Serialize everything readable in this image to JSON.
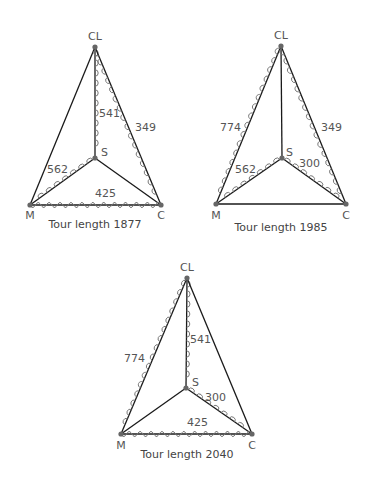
{
  "colors": {
    "edge": "#1a1a1a",
    "loops": "#777777",
    "node": "#666666",
    "text": "#555555"
  },
  "diagrams": [
    {
      "caption": "Tour length 1877",
      "caption_pos": [
        95,
        228
      ],
      "nodes": {
        "CL": {
          "label": "CL",
          "x": 95,
          "y": 47,
          "lx": 95,
          "ly": 40,
          "anchor": "middle"
        },
        "S": {
          "label": "S",
          "x": 95,
          "y": 158,
          "lx": 101,
          "ly": 156,
          "anchor": "start"
        },
        "M": {
          "label": "M",
          "x": 30,
          "y": 205,
          "lx": 30,
          "ly": 219,
          "anchor": "middle"
        },
        "C": {
          "label": "C",
          "x": 161,
          "y": 205,
          "lx": 161,
          "ly": 219,
          "anchor": "middle"
        }
      },
      "edges": [
        {
          "from": "CL",
          "to": "M",
          "tour": false
        },
        {
          "from": "CL",
          "to": "S",
          "tour": true,
          "side": -1,
          "label": "541",
          "lx": 99,
          "ly": 117
        },
        {
          "from": "CL",
          "to": "C",
          "tour": true,
          "side": 1,
          "label": "349",
          "lx": 135,
          "ly": 131
        },
        {
          "from": "S",
          "to": "M",
          "tour": true,
          "side": 1,
          "label": "562",
          "lx": 47,
          "ly": 173
        },
        {
          "from": "S",
          "to": "C",
          "tour": false
        },
        {
          "from": "M",
          "to": "C",
          "tour": true,
          "wave": true,
          "label": "425",
          "lx": 95,
          "ly": 197
        }
      ]
    },
    {
      "caption": "Tour length 1985",
      "caption_pos": [
        281,
        231
      ],
      "nodes": {
        "CL": {
          "label": "CL",
          "x": 281,
          "y": 46,
          "lx": 281,
          "ly": 39,
          "anchor": "middle"
        },
        "S": {
          "label": "S",
          "x": 282,
          "y": 158,
          "lx": 286,
          "ly": 156,
          "anchor": "start"
        },
        "M": {
          "label": "M",
          "x": 216,
          "y": 204,
          "lx": 216,
          "ly": 219,
          "anchor": "middle"
        },
        "C": {
          "label": "C",
          "x": 346,
          "y": 204,
          "lx": 346,
          "ly": 219,
          "anchor": "middle"
        }
      },
      "edges": [
        {
          "from": "CL",
          "to": "M",
          "tour": true,
          "side": 1,
          "label": "774",
          "lx": 220,
          "ly": 131
        },
        {
          "from": "CL",
          "to": "S",
          "tour": false
        },
        {
          "from": "CL",
          "to": "C",
          "tour": true,
          "side": 1,
          "label": "349",
          "lx": 321,
          "ly": 131
        },
        {
          "from": "S",
          "to": "M",
          "tour": true,
          "side": 1,
          "label": "562",
          "lx": 235,
          "ly": 173
        },
        {
          "from": "S",
          "to": "C",
          "tour": true,
          "side": -1,
          "label": "300",
          "lx": 299,
          "ly": 167
        },
        {
          "from": "M",
          "to": "C",
          "tour": false
        }
      ]
    },
    {
      "caption": "Tour length 2040",
      "caption_pos": [
        187,
        458
      ],
      "nodes": {
        "CL": {
          "label": "CL",
          "x": 187,
          "y": 278,
          "lx": 187,
          "ly": 271,
          "anchor": "middle"
        },
        "S": {
          "label": "S",
          "x": 186,
          "y": 388,
          "lx": 192,
          "ly": 386,
          "anchor": "start"
        },
        "M": {
          "label": "M",
          "x": 121,
          "y": 434,
          "lx": 121,
          "ly": 449,
          "anchor": "middle"
        },
        "C": {
          "label": "C",
          "x": 252,
          "y": 434,
          "lx": 252,
          "ly": 449,
          "anchor": "middle"
        }
      },
      "edges": [
        {
          "from": "CL",
          "to": "M",
          "tour": true,
          "side": 1,
          "label": "774",
          "lx": 124,
          "ly": 362
        },
        {
          "from": "CL",
          "to": "S",
          "tour": true,
          "side": -1,
          "label": "541",
          "lx": 190,
          "ly": 343
        },
        {
          "from": "CL",
          "to": "C",
          "tour": false
        },
        {
          "from": "S",
          "to": "M",
          "tour": false
        },
        {
          "from": "S",
          "to": "C",
          "tour": true,
          "side": -1,
          "label": "300",
          "lx": 205,
          "ly": 401
        },
        {
          "from": "M",
          "to": "C",
          "tour": true,
          "wave": true,
          "label": "425",
          "lx": 187,
          "ly": 426
        }
      ]
    }
  ]
}
